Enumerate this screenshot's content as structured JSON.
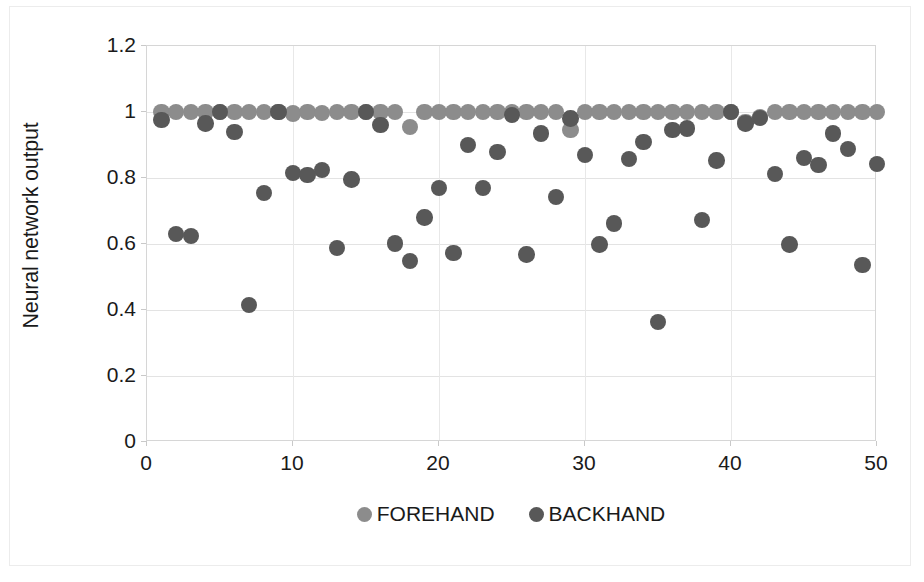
{
  "chart_data": {
    "type": "scatter",
    "title": "",
    "xlabel": "",
    "ylabel": "Neural network output",
    "xlim": [
      0,
      50
    ],
    "ylim": [
      0,
      1.2
    ],
    "xticks": [
      0,
      10,
      20,
      30,
      40,
      50
    ],
    "yticks": [
      0,
      0.2,
      0.4,
      0.6,
      0.8,
      1,
      1.2
    ],
    "xtick_labels": [
      "0",
      "10",
      "20",
      "30",
      "40",
      "50"
    ],
    "ytick_labels": [
      "0",
      "0.2",
      "0.4",
      "0.6",
      "0.8",
      "1",
      "1.2"
    ],
    "grid": "horizontal-and-vertical",
    "legend_position": "bottom-center",
    "series": [
      {
        "name": "FOREHAND",
        "color": "#8c8c8c",
        "marker": "circle",
        "points": [
          [
            1,
            1.0
          ],
          [
            2,
            1.0
          ],
          [
            3,
            1.0
          ],
          [
            4,
            1.0
          ],
          [
            5,
            1.0
          ],
          [
            6,
            1.0
          ],
          [
            7,
            1.0
          ],
          [
            8,
            1.0
          ],
          [
            9,
            1.0
          ],
          [
            10,
            0.995
          ],
          [
            11,
            1.0
          ],
          [
            12,
            0.997
          ],
          [
            13,
            1.0
          ],
          [
            14,
            1.0
          ],
          [
            15,
            1.0
          ],
          [
            16,
            1.0
          ],
          [
            17,
            1.0
          ],
          [
            18,
            0.955
          ],
          [
            19,
            1.0
          ],
          [
            20,
            1.0
          ],
          [
            21,
            1.0
          ],
          [
            22,
            1.0
          ],
          [
            23,
            1.0
          ],
          [
            24,
            1.0
          ],
          [
            25,
            1.0
          ],
          [
            26,
            1.0
          ],
          [
            27,
            1.0
          ],
          [
            28,
            1.0
          ],
          [
            29,
            0.945
          ],
          [
            30,
            1.0
          ],
          [
            31,
            1.0
          ],
          [
            32,
            1.0
          ],
          [
            33,
            1.0
          ],
          [
            34,
            1.0
          ],
          [
            35,
            1.0
          ],
          [
            36,
            1.0
          ],
          [
            37,
            1.0
          ],
          [
            38,
            1.0
          ],
          [
            39,
            1.0
          ],
          [
            40,
            1.0
          ],
          [
            41,
            0.97
          ],
          [
            42,
            0.985
          ],
          [
            43,
            1.0
          ],
          [
            44,
            1.0
          ],
          [
            45,
            1.0
          ],
          [
            46,
            1.0
          ],
          [
            47,
            1.0
          ],
          [
            48,
            1.0
          ],
          [
            49,
            1.0
          ],
          [
            50,
            1.0
          ]
        ]
      },
      {
        "name": "BACKHAND",
        "color": "#585858",
        "marker": "circle",
        "points": [
          [
            1,
            0.975
          ],
          [
            2,
            0.63
          ],
          [
            3,
            0.625
          ],
          [
            4,
            0.965
          ],
          [
            5,
            1.0
          ],
          [
            6,
            0.94
          ],
          [
            7,
            0.415
          ],
          [
            8,
            0.755
          ],
          [
            9,
            1.0
          ],
          [
            10,
            0.815
          ],
          [
            11,
            0.81
          ],
          [
            12,
            0.825
          ],
          [
            13,
            0.588
          ],
          [
            14,
            0.795
          ],
          [
            15,
            1.0
          ],
          [
            16,
            0.96
          ],
          [
            17,
            0.602
          ],
          [
            18,
            0.548
          ],
          [
            19,
            0.68
          ],
          [
            20,
            0.77
          ],
          [
            21,
            0.573
          ],
          [
            22,
            0.9
          ],
          [
            23,
            0.77
          ],
          [
            24,
            0.878
          ],
          [
            25,
            0.99
          ],
          [
            26,
            0.568
          ],
          [
            27,
            0.935
          ],
          [
            28,
            0.742
          ],
          [
            29,
            0.98
          ],
          [
            30,
            0.87
          ],
          [
            31,
            0.598
          ],
          [
            32,
            0.662
          ],
          [
            33,
            0.858
          ],
          [
            34,
            0.91
          ],
          [
            35,
            0.363
          ],
          [
            36,
            0.945
          ],
          [
            37,
            0.95
          ],
          [
            38,
            0.672
          ],
          [
            39,
            0.853
          ],
          [
            40,
            1.0
          ],
          [
            41,
            0.965
          ],
          [
            42,
            0.982
          ],
          [
            43,
            0.812
          ],
          [
            44,
            0.598
          ],
          [
            45,
            0.86
          ],
          [
            46,
            0.84
          ],
          [
            47,
            0.935
          ],
          [
            48,
            0.888
          ],
          [
            49,
            0.537
          ],
          [
            50,
            0.842
          ]
        ]
      }
    ]
  },
  "axis": {
    "ylabel": "Neural network output"
  },
  "legend": {
    "items": [
      {
        "label": "FOREHAND",
        "color": "#8c8c8c"
      },
      {
        "label": "BACKHAND",
        "color": "#585858"
      }
    ]
  }
}
